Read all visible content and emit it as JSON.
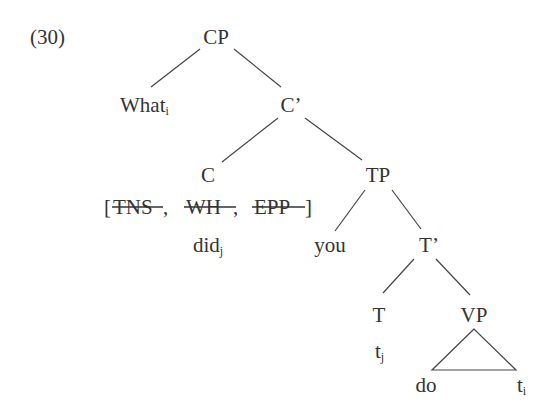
{
  "example_number": "(30)",
  "nodes": {
    "cp": {
      "label": "CP"
    },
    "what": {
      "label": "What",
      "index": "i"
    },
    "c_bar": {
      "label": "C’"
    },
    "c": {
      "label": "C"
    },
    "tp": {
      "label": "TP"
    },
    "features": {
      "open": "[",
      "items": [
        {
          "label": "TNS",
          "struck": true,
          "sep": ","
        },
        {
          "label": "WH",
          "struck": true,
          "sep": ","
        },
        {
          "label": "EPP",
          "struck": true,
          "sep": ""
        }
      ],
      "close": "]"
    },
    "did": {
      "label": "did",
      "index": "j"
    },
    "you": {
      "label": "you"
    },
    "t_bar": {
      "label": "T’"
    },
    "t": {
      "label": "T"
    },
    "t_trace": {
      "label": "t",
      "index": "j"
    },
    "vp": {
      "label": "VP"
    },
    "do": {
      "label": "do"
    },
    "obj_trace": {
      "label": "t",
      "index": "i"
    }
  },
  "colors": {
    "text": "#333333",
    "line": "#444444",
    "background": "#ffffff"
  }
}
